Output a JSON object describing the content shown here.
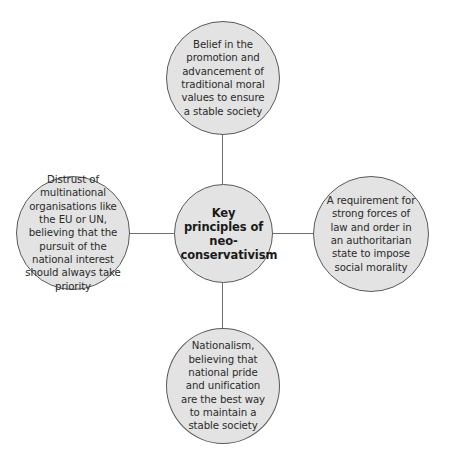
{
  "diagram": {
    "type": "mind-map",
    "colors": {
      "node_fill": "#e3e3e3",
      "node_border": "#5a5a5a",
      "connector": "#6e6e6e",
      "text": "#2a2a2a",
      "background": "#ffffff"
    },
    "center": {
      "label": "Key principles of neo-conservativism"
    },
    "nodes": {
      "top": {
        "label": "Belief in the promotion and advancement of traditional moral values to ensure a stable society"
      },
      "left": {
        "label": "Distrust of multinational organisations like the EU or UN, believing that the pursuit of the national interest should always take priority"
      },
      "right": {
        "label": "A requirement for strong forces of law and order in an authoritarian state to impose social morality"
      },
      "bottom": {
        "label": "Nationalism, believing that national pride and unification are the best way to maintain a stable society"
      }
    }
  }
}
